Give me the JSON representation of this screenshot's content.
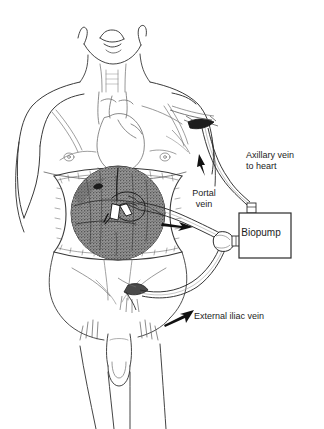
{
  "figure": {
    "background_color": "#ffffff",
    "line_color": "#3a3a3a",
    "ink_color": "#1c1c1c",
    "organ_fill": "#8c8c8c"
  },
  "labels": {
    "axillary": "Axillary vein\nto heart",
    "axillary_line1": "Axillary vein",
    "axillary_line2": "to heart",
    "portal_line1": "Portal",
    "portal_line2": "vein",
    "iliac": "External iliac vein",
    "biopump": "Biopump"
  },
  "anatomy": [
    {
      "name": "head-chin",
      "label": "Chin and jaw viewed from below"
    },
    {
      "name": "neck",
      "label": "Neck with trachea"
    },
    {
      "name": "torso",
      "label": "Thorax and abdomen"
    },
    {
      "name": "heart",
      "label": "Heart with great vessels"
    },
    {
      "name": "liver",
      "label": "Liver in open surgical field"
    },
    {
      "name": "arms",
      "label": "Upper arms"
    },
    {
      "name": "legs",
      "label": "Thighs"
    },
    {
      "name": "genitalia",
      "label": "Male genitalia"
    }
  ],
  "circuit": {
    "device": "Biopump",
    "flow_arrows": 3,
    "incisions": [
      {
        "name": "axillary-incision",
        "label": "Axillary incision"
      },
      {
        "name": "groin-incision",
        "label": "Groin incision"
      },
      {
        "name": "abdominal-incision",
        "label": "Abdominal incision"
      }
    ],
    "tubes": [
      {
        "name": "portal-outflow-tube",
        "from": "Portal vein",
        "to": "Biopump"
      },
      {
        "name": "iliac-tube",
        "from": "External iliac vein",
        "to": "Biopump"
      },
      {
        "name": "axillary-return-tube",
        "from": "Biopump",
        "to": "Axillary vein"
      }
    ]
  }
}
